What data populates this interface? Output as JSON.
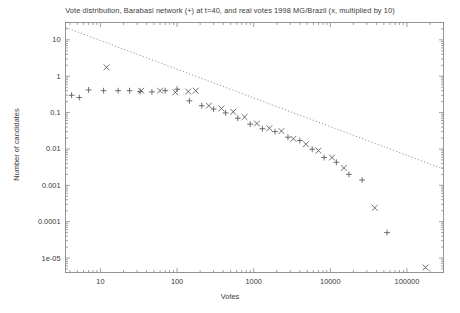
{
  "chart_data": {
    "type": "scatter",
    "title": "Vote distribution, Barabasi network (+) at t=40, and real votes 1998 MG/Brazil (x, multiplied by 10)",
    "xlabel": "Votes",
    "ylabel": "Number of candidates",
    "xscale": "log",
    "yscale": "log",
    "xlim": [
      3.5,
      300000
    ],
    "ylim": [
      4e-06,
      30
    ],
    "grid": false,
    "legend_position": "none",
    "xticks": [
      {
        "value": 10,
        "label": "10"
      },
      {
        "value": 100,
        "label": "100"
      },
      {
        "value": 1000,
        "label": "1000"
      },
      {
        "value": 10000,
        "label": "10000"
      },
      {
        "value": 100000,
        "label": "100000"
      }
    ],
    "yticks": [
      {
        "value": 10,
        "label": "10"
      },
      {
        "value": 1,
        "label": "1"
      },
      {
        "value": 0.1,
        "label": "0.1"
      },
      {
        "value": 0.01,
        "label": "0.01"
      },
      {
        "value": 0.001,
        "label": "0.001"
      },
      {
        "value": 0.0001,
        "label": "0.0001"
      },
      {
        "value": 1e-05,
        "label": "1e-05"
      }
    ],
    "series": [
      {
        "name": "Barabasi network (+) at t=40",
        "marker": "plus",
        "color": "#555555",
        "points": [
          [
            4.2,
            0.3
          ],
          [
            5.3,
            0.26
          ],
          [
            7.0,
            0.42
          ],
          [
            11.0,
            0.4
          ],
          [
            17.0,
            0.4
          ],
          [
            24.0,
            0.4
          ],
          [
            33.0,
            0.38
          ],
          [
            47.0,
            0.37
          ],
          [
            70.0,
            0.4
          ],
          [
            100.0,
            0.44
          ],
          [
            145.0,
            0.21
          ],
          [
            210.0,
            0.155
          ],
          [
            300.0,
            0.125
          ],
          [
            430.0,
            0.098
          ],
          [
            620.0,
            0.07
          ],
          [
            900.0,
            0.048
          ],
          [
            1300.0,
            0.036
          ],
          [
            1900.0,
            0.03
          ],
          [
            2800.0,
            0.021
          ],
          [
            4000.0,
            0.017
          ],
          [
            5800.0,
            0.0098
          ],
          [
            8300.0,
            0.0058
          ],
          [
            12000.0,
            0.0043
          ],
          [
            17500.0,
            0.002
          ],
          [
            26000.0,
            0.0014
          ],
          [
            55000.0,
            5e-05
          ]
        ]
      },
      {
        "name": "real votes 1998 MG/Brazil (x, multiplied by 10)",
        "marker": "cross",
        "color": "#555555",
        "points": [
          [
            12.0,
            1.75
          ],
          [
            34.0,
            0.4
          ],
          [
            60.0,
            0.4
          ],
          [
            95.0,
            0.36
          ],
          [
            140.0,
            0.38
          ],
          [
            175.0,
            0.4
          ],
          [
            260.0,
            0.155
          ],
          [
            380.0,
            0.13
          ],
          [
            540.0,
            0.105
          ],
          [
            760.0,
            0.075
          ],
          [
            1100.0,
            0.05
          ],
          [
            1600.0,
            0.037
          ],
          [
            2300.0,
            0.031
          ],
          [
            3300.0,
            0.019
          ],
          [
            4800.0,
            0.0135
          ],
          [
            7000.0,
            0.009
          ],
          [
            10500.0,
            0.0058
          ],
          [
            15000.0,
            0.003
          ],
          [
            38000.0,
            0.00024
          ],
          [
            175000.0,
            5.5e-06
          ]
        ]
      }
    ],
    "fit_line": {
      "name": "power-law guide line",
      "style": "dotted",
      "color": "#777777",
      "start": [
        3.5,
        22.0
      ],
      "end": [
        300000,
        0.0028
      ]
    }
  }
}
